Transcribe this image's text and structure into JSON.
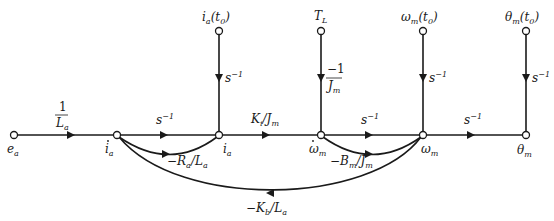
{
  "diagram": {
    "type": "signal-flow-graph",
    "nodes": {
      "ea": {
        "label": "e",
        "sub": "a"
      },
      "ia_dot": {
        "label": "i",
        "sub": "a",
        "dot": true
      },
      "ia": {
        "label": "i",
        "sub": "a"
      },
      "wm_dot": {
        "label": "ω",
        "sub": "m",
        "dot": true
      },
      "wm": {
        "label": "ω",
        "sub": "m"
      },
      "thm": {
        "label": "θ",
        "sub": "m"
      },
      "ia_t0": {
        "label": "i",
        "sub": "a",
        "arg": "(t",
        "argsub": "0",
        "close": ")"
      },
      "TL": {
        "label": "T",
        "sub": "L"
      },
      "wm_t0": {
        "label": "ω",
        "sub": "m",
        "arg": "(t",
        "argsub": "0",
        "close": ")"
      },
      "thm_t0": {
        "label": "θ",
        "sub": "m",
        "arg": "(t",
        "argsub": "0",
        "close": ")"
      }
    },
    "branches": {
      "ea_to_iadot": {
        "num": "1",
        "den": "L",
        "densub": "a"
      },
      "iadot_to_ia": {
        "base": "s",
        "sup": "−1"
      },
      "ia_to_wmdot": {
        "a": "K",
        "asub": "i",
        "b": "/J",
        "bsub": "m"
      },
      "wmdot_to_wm": {
        "base": "s",
        "sup": "−1"
      },
      "wm_to_thm": {
        "base": "s",
        "sup": "−1"
      },
      "ia_t0_to_ia": {
        "base": "s",
        "sup": "−1"
      },
      "TL_to_wmdot": {
        "num": "−1",
        "den": "J",
        "densub": "m"
      },
      "wm_t0_to_wm": {
        "base": "s",
        "sup": "−1"
      },
      "thm_t0_to_thm": {
        "base": "s",
        "sup": "−1"
      },
      "ia_to_iadot_fb": {
        "a": "−R",
        "asub": "a",
        "b": "/L",
        "bsub": "a"
      },
      "wm_to_wmdot_fb": {
        "a": "−B",
        "asub": "m",
        "b": "/J",
        "bsub": "m"
      },
      "wm_to_iadot_fb": {
        "a": "−K",
        "asub": "b",
        "b": "/L",
        "bsub": "a"
      }
    }
  }
}
